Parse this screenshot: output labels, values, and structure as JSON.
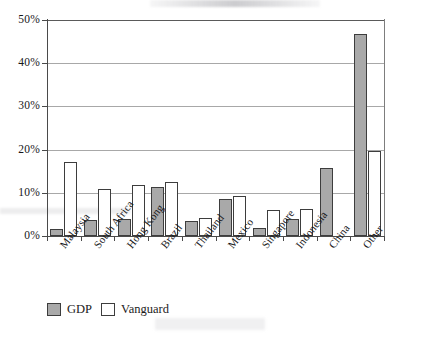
{
  "chart_data": {
    "type": "bar",
    "title": "",
    "xlabel": "",
    "ylabel": "",
    "ylim": [
      0,
      50
    ],
    "ytick_labels": [
      "50%",
      "40%",
      "30%",
      "20%",
      "10%",
      "0%"
    ],
    "ytick_values": [
      50,
      40,
      30,
      20,
      10,
      0
    ],
    "grid": true,
    "legend_position": "bottom-left",
    "categories": [
      "Malaysia",
      "South Africa",
      "Hong Kong",
      "Brazil",
      "Thailand",
      "Mexico",
      "Singapore",
      "Indonesia",
      "China",
      "Other"
    ],
    "series": [
      {
        "name": "GDP",
        "color": "#a9a9a9",
        "values": [
          1.7,
          3.7,
          4.0,
          11.4,
          3.5,
          8.6,
          1.8,
          4.0,
          15.7,
          46.8
        ]
      },
      {
        "name": "Vanguard",
        "color": "#ffffff",
        "values": [
          17.2,
          10.8,
          11.9,
          12.4,
          4.2,
          9.2,
          6.1,
          6.2,
          null,
          19.7
        ]
      }
    ]
  },
  "legend": {
    "items": [
      {
        "label": "GDP",
        "swatch": "gdp"
      },
      {
        "label": "Vanguard",
        "swatch": "vanguard"
      }
    ]
  },
  "colors": {
    "gdp_fill": "#a9a9a9",
    "vanguard_fill": "#ffffff",
    "bar_outline": "#3d3d3d",
    "axis": "#4a4a4a",
    "gridline": "#a8a8a8",
    "text": "#17171a"
  }
}
